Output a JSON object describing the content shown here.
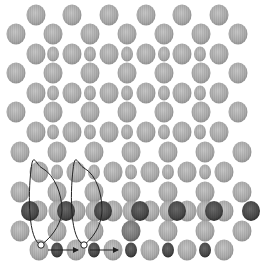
{
  "diagram": {
    "colors": {
      "background": "#ffffff",
      "light_atom": "#a8a8a8",
      "light_atom_edge": "#8c8c8c",
      "dark_atom": "#4a4a4a",
      "dark_atom_edge": "#222222",
      "medium_atom": "#7a7a7a",
      "path_line": "#222222",
      "vacancy_fill": "#ffffff"
    },
    "rows": [
      {
        "id": "A",
        "y": 15,
        "atoms": [
          {
            "x": 36,
            "t": "L"
          },
          {
            "x": 72,
            "t": "L"
          },
          {
            "x": 109,
            "t": "L"
          },
          {
            "x": 146,
            "t": "L"
          },
          {
            "x": 182,
            "t": "L"
          },
          {
            "x": 219,
            "t": "L"
          }
        ]
      },
      {
        "id": "B",
        "y": 34,
        "atoms": [
          {
            "x": 16,
            "t": "L"
          },
          {
            "x": 53,
            "t": "L"
          },
          {
            "x": 90,
            "t": "L"
          },
          {
            "x": 127,
            "t": "L"
          },
          {
            "x": 164,
            "t": "L"
          },
          {
            "x": 201,
            "t": "L"
          },
          {
            "x": 238,
            "t": "L"
          }
        ]
      },
      {
        "id": "C",
        "y": 54,
        "atoms": [
          {
            "x": 36,
            "t": "L"
          },
          {
            "x": 53,
            "t": "S"
          },
          {
            "x": 72,
            "t": "L"
          },
          {
            "x": 90,
            "t": "S"
          },
          {
            "x": 109,
            "t": "L"
          },
          {
            "x": 127,
            "t": "S"
          },
          {
            "x": 146,
            "t": "L"
          },
          {
            "x": 164,
            "t": "S"
          },
          {
            "x": 182,
            "t": "L"
          },
          {
            "x": 200,
            "t": "S"
          },
          {
            "x": 219,
            "t": "L"
          }
        ]
      },
      {
        "id": "D",
        "y": 73,
        "atoms": [
          {
            "x": 16,
            "t": "L"
          },
          {
            "x": 53,
            "t": "L"
          },
          {
            "x": 90,
            "t": "L"
          },
          {
            "x": 127,
            "t": "L"
          },
          {
            "x": 164,
            "t": "L"
          },
          {
            "x": 201,
            "t": "L"
          },
          {
            "x": 238,
            "t": "L"
          }
        ]
      },
      {
        "id": "E",
        "y": 93,
        "atoms": [
          {
            "x": 36,
            "t": "L"
          },
          {
            "x": 53,
            "t": "S"
          },
          {
            "x": 72,
            "t": "L"
          },
          {
            "x": 90,
            "t": "S"
          },
          {
            "x": 109,
            "t": "L"
          },
          {
            "x": 127,
            "t": "S"
          },
          {
            "x": 146,
            "t": "L"
          },
          {
            "x": 164,
            "t": "S"
          },
          {
            "x": 182,
            "t": "L"
          },
          {
            "x": 200,
            "t": "S"
          },
          {
            "x": 219,
            "t": "L"
          }
        ]
      },
      {
        "id": "F",
        "y": 112,
        "atoms": [
          {
            "x": 16,
            "t": "L"
          },
          {
            "x": 53,
            "t": "L"
          },
          {
            "x": 90,
            "t": "L"
          },
          {
            "x": 127,
            "t": "L"
          },
          {
            "x": 164,
            "t": "L"
          },
          {
            "x": 201,
            "t": "L"
          },
          {
            "x": 238,
            "t": "L"
          }
        ]
      },
      {
        "id": "G",
        "y": 132,
        "atoms": [
          {
            "x": 36,
            "t": "L"
          },
          {
            "x": 53,
            "t": "S"
          },
          {
            "x": 72,
            "t": "L"
          },
          {
            "x": 90,
            "t": "S"
          },
          {
            "x": 109,
            "t": "L"
          },
          {
            "x": 127,
            "t": "S"
          },
          {
            "x": 146,
            "t": "L"
          },
          {
            "x": 164,
            "t": "S"
          },
          {
            "x": 182,
            "t": "L"
          },
          {
            "x": 200,
            "t": "S"
          },
          {
            "x": 219,
            "t": "L"
          }
        ]
      },
      {
        "id": "H",
        "y": 152,
        "atoms": [
          {
            "x": 20,
            "t": "L"
          },
          {
            "x": 57,
            "t": "L"
          },
          {
            "x": 94,
            "t": "L"
          },
          {
            "x": 131,
            "t": "L"
          },
          {
            "x": 168,
            "t": "L"
          },
          {
            "x": 205,
            "t": "L"
          },
          {
            "x": 242,
            "t": "L"
          }
        ]
      },
      {
        "id": "I",
        "y": 172,
        "atoms": [
          {
            "x": 39,
            "t": "L"
          },
          {
            "x": 57,
            "t": "S"
          },
          {
            "x": 76,
            "t": "L"
          },
          {
            "x": 94,
            "t": "S"
          },
          {
            "x": 113,
            "t": "L"
          },
          {
            "x": 131,
            "t": "S"
          },
          {
            "x": 150,
            "t": "L"
          },
          {
            "x": 168,
            "t": "S"
          },
          {
            "x": 187,
            "t": "L"
          },
          {
            "x": 205,
            "t": "S"
          },
          {
            "x": 224,
            "t": "L"
          }
        ]
      },
      {
        "id": "J",
        "y": 192,
        "atoms": [
          {
            "x": 20,
            "t": "L"
          },
          {
            "x": 57,
            "t": "L"
          },
          {
            "x": 94,
            "t": "L"
          },
          {
            "x": 131,
            "t": "L"
          },
          {
            "x": 168,
            "t": "L"
          },
          {
            "x": 205,
            "t": "L"
          },
          {
            "x": 242,
            "t": "L"
          }
        ]
      },
      {
        "id": "K",
        "y": 211,
        "atoms": [
          {
            "x": 38,
            "t": "L"
          },
          {
            "x": 30,
            "t": "D"
          },
          {
            "x": 58,
            "t": "L"
          },
          {
            "x": 76,
            "t": "L"
          },
          {
            "x": 66,
            "t": "D"
          },
          {
            "x": 95,
            "t": "L"
          },
          {
            "x": 113,
            "t": "L"
          },
          {
            "x": 103,
            "t": "D"
          },
          {
            "x": 132,
            "t": "L"
          },
          {
            "x": 150,
            "t": "L"
          },
          {
            "x": 140,
            "t": "D"
          },
          {
            "x": 169,
            "t": "L"
          },
          {
            "x": 187,
            "t": "L"
          },
          {
            "x": 177,
            "t": "D"
          },
          {
            "x": 206,
            "t": "L"
          },
          {
            "x": 224,
            "t": "L"
          },
          {
            "x": 214,
            "t": "D"
          },
          {
            "x": 251,
            "t": "D"
          }
        ]
      },
      {
        "id": "L",
        "y": 231,
        "atoms": [
          {
            "x": 20,
            "t": "L"
          },
          {
            "x": 57,
            "t": "L"
          },
          {
            "x": 94,
            "t": "L"
          },
          {
            "x": 131,
            "t": "M"
          },
          {
            "x": 168,
            "t": "L"
          },
          {
            "x": 205,
            "t": "L"
          },
          {
            "x": 242,
            "t": "L"
          }
        ]
      },
      {
        "id": "M",
        "y": 250,
        "atoms": [
          {
            "x": 39,
            "t": "L"
          },
          {
            "x": 57,
            "t": "DS"
          },
          {
            "x": 76,
            "t": "L"
          },
          {
            "x": 94,
            "t": "DS"
          },
          {
            "x": 113,
            "t": "L"
          },
          {
            "x": 131,
            "t": "DS"
          },
          {
            "x": 150,
            "t": "L"
          },
          {
            "x": 168,
            "t": "DS"
          },
          {
            "x": 187,
            "t": "L"
          },
          {
            "x": 205,
            "t": "DS"
          },
          {
            "x": 224,
            "t": "L"
          }
        ]
      }
    ],
    "paths": [
      {
        "name": "diffusion-loop-1",
        "d": "M 41 245 C 28 240, 28 195, 31 170 C 33 150, 36 165, 42 168 C 55 175, 62 195, 62 210 C 62 220, 55 235, 41 245"
      },
      {
        "name": "diffusion-loop-2",
        "d": "M 84 245 C 70 240, 70 195, 73 170 C 75 150, 78 165, 84 168 C 97 175, 102 195, 102 210 C 102 220, 97 235, 84 245"
      }
    ],
    "vacancies": [
      {
        "x": 41,
        "y": 245
      },
      {
        "x": 84,
        "y": 245
      }
    ],
    "arrows": [
      {
        "x1": 48,
        "y1": 250,
        "x2": 78,
        "y2": 250
      },
      {
        "x1": 90,
        "y1": 250,
        "x2": 118,
        "y2": 250
      }
    ]
  }
}
